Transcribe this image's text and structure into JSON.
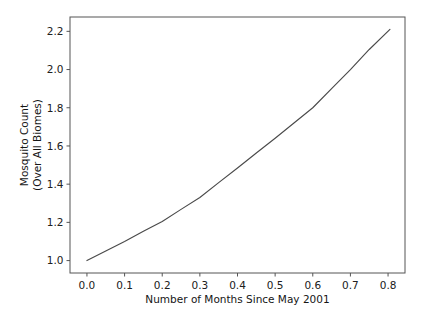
{
  "chart_data": {
    "type": "line",
    "title": "",
    "xlabel": "Number of Months Since May 2001",
    "ylabel": "Mosquito Count\n(Over All Biomes)",
    "ylabel_line1": "Mosquito Count",
    "ylabel_line2": "(Over All Biomes)",
    "xlim": [
      -0.045,
      0.845
    ],
    "ylim": [
      0.935,
      2.275
    ],
    "grid": false,
    "legend": null,
    "line_color": "#4a4a4a",
    "background_color": "#ffffff",
    "xticks": [
      0.0,
      0.1,
      0.2,
      0.3,
      0.4,
      0.5,
      0.6,
      0.7,
      0.8
    ],
    "xtick_labels": [
      "0.0",
      "0.1",
      "0.2",
      "0.3",
      "0.4",
      "0.5",
      "0.6",
      "0.7",
      "0.8"
    ],
    "yticks": [
      1.0,
      1.2,
      1.4,
      1.6,
      1.8,
      2.0,
      2.2
    ],
    "ytick_labels": [
      "1.0",
      "1.2",
      "1.4",
      "1.6",
      "1.8",
      "2.0",
      "2.2"
    ],
    "series": [
      {
        "name": "mosquito-count",
        "x": [
          0.0,
          0.05,
          0.1,
          0.15,
          0.2,
          0.25,
          0.3,
          0.35,
          0.4,
          0.45,
          0.5,
          0.55,
          0.6,
          0.65,
          0.7,
          0.75,
          0.805
        ],
        "values": [
          1.0,
          1.05,
          1.1,
          1.153,
          1.205,
          1.268,
          1.33,
          1.408,
          1.485,
          1.563,
          1.64,
          1.72,
          1.8,
          1.9,
          2.0,
          2.105,
          2.21
        ]
      }
    ]
  },
  "figure": {
    "canvas_width": 425,
    "canvas_height": 322
  }
}
